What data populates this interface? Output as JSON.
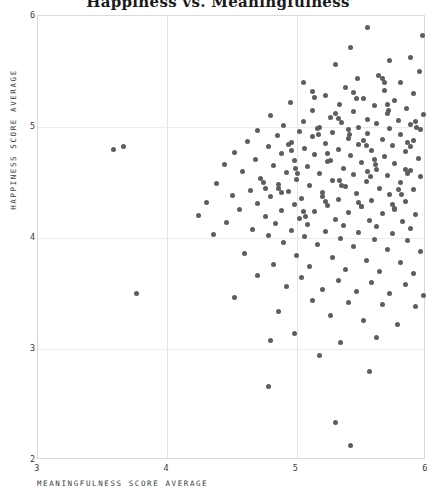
{
  "chart_data": {
    "type": "scatter",
    "title": "Happiness vs. Meaningfulness",
    "xlabel": "MEANINGFULNESS SCORE AVERAGE",
    "ylabel": "HAPPINESS SCORE AVERAGE",
    "xlim": [
      3,
      6
    ],
    "ylim": [
      2,
      6
    ],
    "xticks": [
      3,
      4,
      5,
      6
    ],
    "yticks": [
      2,
      3,
      4,
      5,
      6
    ],
    "grid": true,
    "legend": null,
    "marker_color": "#5e5e5e",
    "marker_size_px": 5,
    "points": [
      [
        5.55,
        5.9
      ],
      [
        5.97,
        5.82
      ],
      [
        5.42,
        5.72
      ],
      [
        5.88,
        5.63
      ],
      [
        5.72,
        5.6
      ],
      [
        5.3,
        5.56
      ],
      [
        5.95,
        5.5
      ],
      [
        5.63,
        5.46
      ],
      [
        5.47,
        5.44
      ],
      [
        5.8,
        5.4
      ],
      [
        5.05,
        5.4
      ],
      [
        5.38,
        5.36
      ],
      [
        5.68,
        5.33
      ],
      [
        5.9,
        5.3
      ],
      [
        5.22,
        5.28
      ],
      [
        5.52,
        5.26
      ],
      [
        5.76,
        5.24
      ],
      [
        4.95,
        5.22
      ],
      [
        5.33,
        5.2
      ],
      [
        5.6,
        5.19
      ],
      [
        5.85,
        5.17
      ],
      [
        5.12,
        5.15
      ],
      [
        5.44,
        5.14
      ],
      [
        5.7,
        5.12
      ],
      [
        5.98,
        5.11
      ],
      [
        4.8,
        5.1
      ],
      [
        5.26,
        5.09
      ],
      [
        5.55,
        5.07
      ],
      [
        5.79,
        5.06
      ],
      [
        5.05,
        5.05
      ],
      [
        5.35,
        5.04
      ],
      [
        5.62,
        5.03
      ],
      [
        5.88,
        5.02
      ],
      [
        4.9,
        5.01
      ],
      [
        5.18,
        5.0
      ],
      [
        5.48,
        5.0
      ],
      [
        5.72,
        4.99
      ],
      [
        5.96,
        4.98
      ],
      [
        4.7,
        4.97
      ],
      [
        5.02,
        4.96
      ],
      [
        5.28,
        4.95
      ],
      [
        5.55,
        4.94
      ],
      [
        5.8,
        4.93
      ],
      [
        4.85,
        4.92
      ],
      [
        5.12,
        4.91
      ],
      [
        5.4,
        4.9
      ],
      [
        5.66,
        4.89
      ],
      [
        5.9,
        4.88
      ],
      [
        4.62,
        4.87
      ],
      [
        4.96,
        4.86
      ],
      [
        5.22,
        4.85
      ],
      [
        5.48,
        4.84
      ],
      [
        5.74,
        4.83
      ],
      [
        4.78,
        4.82
      ],
      [
        5.06,
        4.81
      ],
      [
        5.32,
        4.8
      ],
      [
        5.58,
        4.79
      ],
      [
        5.84,
        4.78
      ],
      [
        3.58,
        4.8
      ],
      [
        3.66,
        4.82
      ],
      [
        4.52,
        4.77
      ],
      [
        4.88,
        4.76
      ],
      [
        5.14,
        4.75
      ],
      [
        5.42,
        4.74
      ],
      [
        5.68,
        4.73
      ],
      [
        5.94,
        4.72
      ],
      [
        4.68,
        4.71
      ],
      [
        4.98,
        4.7
      ],
      [
        5.24,
        4.69
      ],
      [
        5.5,
        4.68
      ],
      [
        5.76,
        4.67
      ],
      [
        4.44,
        4.66
      ],
      [
        4.82,
        4.65
      ],
      [
        5.08,
        4.64
      ],
      [
        5.36,
        4.63
      ],
      [
        5.62,
        4.62
      ],
      [
        5.88,
        4.61
      ],
      [
        4.58,
        4.6
      ],
      [
        4.92,
        4.59
      ],
      [
        5.18,
        4.58
      ],
      [
        5.44,
        4.57
      ],
      [
        5.7,
        4.56
      ],
      [
        5.96,
        4.55
      ],
      [
        4.72,
        4.54
      ],
      [
        5.0,
        4.53
      ],
      [
        5.28,
        4.52
      ],
      [
        5.54,
        4.51
      ],
      [
        5.8,
        4.5
      ],
      [
        4.38,
        4.49
      ],
      [
        4.86,
        4.48
      ],
      [
        5.1,
        4.47
      ],
      [
        5.38,
        4.46
      ],
      [
        5.64,
        4.45
      ],
      [
        5.9,
        4.44
      ],
      [
        4.64,
        4.43
      ],
      [
        4.94,
        4.42
      ],
      [
        5.2,
        4.41
      ],
      [
        5.46,
        4.4
      ],
      [
        5.72,
        4.39
      ],
      [
        4.5,
        4.38
      ],
      [
        4.8,
        4.37
      ],
      [
        5.04,
        4.36
      ],
      [
        5.32,
        4.35
      ],
      [
        5.58,
        4.34
      ],
      [
        5.84,
        4.33
      ],
      [
        4.3,
        4.32
      ],
      [
        4.7,
        4.31
      ],
      [
        4.98,
        4.3
      ],
      [
        5.24,
        4.29
      ],
      [
        5.5,
        4.28
      ],
      [
        5.76,
        4.27
      ],
      [
        4.56,
        4.26
      ],
      [
        4.88,
        4.25
      ],
      [
        5.14,
        4.24
      ],
      [
        5.4,
        4.23
      ],
      [
        5.66,
        4.22
      ],
      [
        5.92,
        4.21
      ],
      [
        4.24,
        4.2
      ],
      [
        4.76,
        4.19
      ],
      [
        5.02,
        4.18
      ],
      [
        5.3,
        4.17
      ],
      [
        5.56,
        4.16
      ],
      [
        5.82,
        4.15
      ],
      [
        4.46,
        4.14
      ],
      [
        4.84,
        4.13
      ],
      [
        5.08,
        4.12
      ],
      [
        5.36,
        4.11
      ],
      [
        5.62,
        4.1
      ],
      [
        5.88,
        4.09
      ],
      [
        4.66,
        4.08
      ],
      [
        4.96,
        4.07
      ],
      [
        5.22,
        4.06
      ],
      [
        5.48,
        4.05
      ],
      [
        5.74,
        4.04
      ],
      [
        4.36,
        4.03
      ],
      [
        4.78,
        4.02
      ],
      [
        5.06,
        4.01
      ],
      [
        5.34,
        4.0
      ],
      [
        5.6,
        3.99
      ],
      [
        5.86,
        3.98
      ],
      [
        4.9,
        3.96
      ],
      [
        5.16,
        3.94
      ],
      [
        5.44,
        3.92
      ],
      [
        5.7,
        3.9
      ],
      [
        5.96,
        3.88
      ],
      [
        4.6,
        3.86
      ],
      [
        5.0,
        3.84
      ],
      [
        5.28,
        3.82
      ],
      [
        5.54,
        3.8
      ],
      [
        5.8,
        3.78
      ],
      [
        4.82,
        3.76
      ],
      [
        5.1,
        3.74
      ],
      [
        5.38,
        3.72
      ],
      [
        5.64,
        3.7
      ],
      [
        5.9,
        3.68
      ],
      [
        4.7,
        3.66
      ],
      [
        5.04,
        3.64
      ],
      [
        5.32,
        3.62
      ],
      [
        5.58,
        3.6
      ],
      [
        5.84,
        3.58
      ],
      [
        4.92,
        3.56
      ],
      [
        5.2,
        3.54
      ],
      [
        5.46,
        3.52
      ],
      [
        5.72,
        3.5
      ],
      [
        5.98,
        3.48
      ],
      [
        4.52,
        3.46
      ],
      [
        5.12,
        3.44
      ],
      [
        5.4,
        3.42
      ],
      [
        5.66,
        3.4
      ],
      [
        5.92,
        3.38
      ],
      [
        3.76,
        3.5
      ],
      [
        4.86,
        3.34
      ],
      [
        5.26,
        3.3
      ],
      [
        5.52,
        3.26
      ],
      [
        5.78,
        3.22
      ],
      [
        4.98,
        3.14
      ],
      [
        5.34,
        3.06
      ],
      [
        5.62,
        3.1
      ],
      [
        4.8,
        3.08
      ],
      [
        5.18,
        2.94
      ],
      [
        5.56,
        2.8
      ],
      [
        4.78,
        2.66
      ],
      [
        5.3,
        2.34
      ],
      [
        5.42,
        2.13
      ],
      [
        5.16,
        4.99
      ],
      [
        5.17,
        4.93
      ],
      [
        5.44,
        5.31
      ],
      [
        5.46,
        5.26
      ],
      [
        5.24,
        4.76
      ],
      [
        5.26,
        4.7
      ],
      [
        5.86,
        4.86
      ],
      [
        5.88,
        4.82
      ],
      [
        4.99,
        4.63
      ],
      [
        5.01,
        4.58
      ],
      [
        5.55,
        4.6
      ],
      [
        5.57,
        4.55
      ],
      [
        5.7,
        5.2
      ],
      [
        5.71,
        5.15
      ],
      [
        5.33,
        4.52
      ],
      [
        5.35,
        4.47
      ],
      [
        4.86,
        4.45
      ],
      [
        4.88,
        4.41
      ],
      [
        5.6,
        4.71
      ],
      [
        5.61,
        4.66
      ],
      [
        5.12,
        5.32
      ],
      [
        5.14,
        5.27
      ],
      [
        5.79,
        4.44
      ],
      [
        5.81,
        4.39
      ],
      [
        5.05,
        4.24
      ],
      [
        5.07,
        4.19
      ],
      [
        5.48,
        4.32
      ],
      [
        5.5,
        4.28
      ],
      [
        5.92,
        5.05
      ],
      [
        5.93,
        5.0
      ],
      [
        4.74,
        4.5
      ],
      [
        4.76,
        4.45
      ],
      [
        5.4,
        4.98
      ],
      [
        5.41,
        4.93
      ],
      [
        5.66,
        5.44
      ],
      [
        5.68,
        5.4
      ],
      [
        5.2,
        4.37
      ],
      [
        5.22,
        4.33
      ],
      [
        5.84,
        4.62
      ],
      [
        5.86,
        4.58
      ],
      [
        4.94,
        4.84
      ],
      [
        4.96,
        4.79
      ],
      [
        5.52,
        4.88
      ],
      [
        5.54,
        4.83
      ],
      [
        5.3,
        5.12
      ],
      [
        5.32,
        5.08
      ],
      [
        5.74,
        4.3
      ],
      [
        5.76,
        4.26
      ]
    ]
  }
}
